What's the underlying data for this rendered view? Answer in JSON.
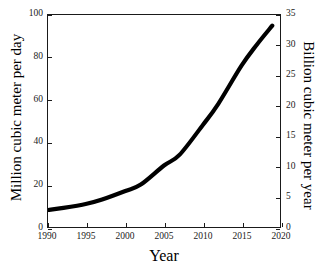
{
  "chart_data": {
    "type": "line",
    "title": "",
    "xlabel": "Year",
    "ylabel": "Million cubic meter per day",
    "ylabel_right": "Billion cubic meter per year",
    "xlim": [
      1990,
      2020
    ],
    "ylim": [
      0,
      100
    ],
    "ylim_right": [
      0,
      35
    ],
    "grid": false,
    "legend": "none",
    "xticks": [
      "1990",
      "1995",
      "2000",
      "2005",
      "2010",
      "2015",
      "2020"
    ],
    "xtick_values": [
      1990,
      1995,
      2000,
      2005,
      2010,
      2015,
      2020
    ],
    "yticks_left": [
      "0",
      "20",
      "40",
      "60",
      "80",
      "100"
    ],
    "ytick_values_left": [
      0,
      20,
      40,
      60,
      80,
      100
    ],
    "yticks_right": [
      "0",
      "5",
      "10",
      "15",
      "20",
      "25",
      "30",
      "35"
    ],
    "ytick_values_right": [
      0,
      5,
      10,
      15,
      20,
      25,
      30,
      35
    ],
    "line_color": "#000000",
    "line_width": 4.2,
    "series": [
      {
        "name": "Natural gas consumption",
        "x": [
          1990,
          1992,
          1995,
          1997,
          2000,
          2002,
          2005,
          2007,
          2010,
          2012,
          2015,
          2017,
          2019
        ],
        "values": [
          8,
          9,
          11,
          13,
          17,
          20,
          29,
          34,
          48,
          58,
          76,
          86,
          95
        ]
      }
    ]
  }
}
